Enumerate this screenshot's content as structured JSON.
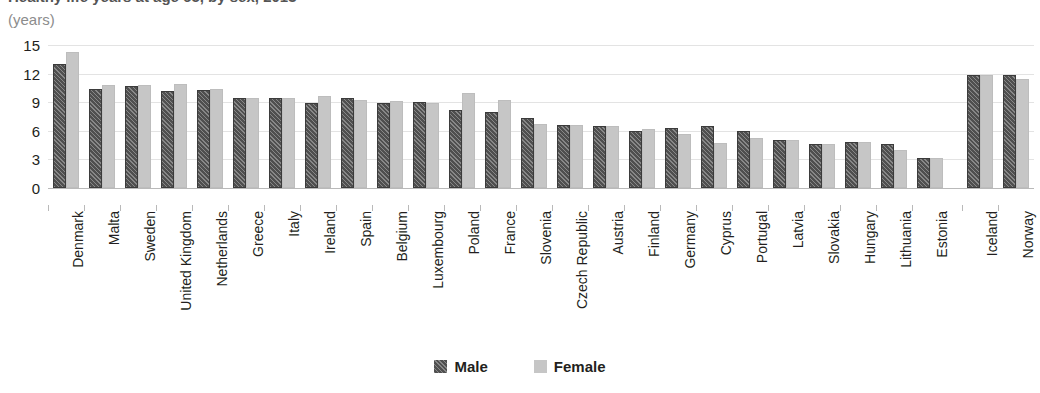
{
  "header": {
    "title_clipped": "Healthy life years at age 65, by sex, 2013",
    "units": "(years)"
  },
  "legend": {
    "position": "bottom-center",
    "items": [
      {
        "label": "Male",
        "color": "#4f4f4f",
        "pattern": "diagonal-hatch"
      },
      {
        "label": "Female",
        "color": "#c6c6c6",
        "pattern": "solid"
      }
    ]
  },
  "chart_data": {
    "type": "bar",
    "title": "Healthy life years at age 65, by sex, 2013",
    "xlabel": "",
    "ylabel": "(years)",
    "ylim": [
      0,
      15
    ],
    "yticks": [
      0,
      3,
      6,
      9,
      12,
      15
    ],
    "grid": true,
    "orientation": "vertical",
    "grouping": "grouped",
    "categories": [
      "Denmark",
      "Malta",
      "Sweden",
      "United Kingdom",
      "Netherlands",
      "Greece",
      "Italy",
      "Ireland",
      "Spain",
      "Belgium",
      "Luxembourg",
      "Poland",
      "France",
      "Slovenia",
      "Czech Republic",
      "Austria",
      "Finland",
      "Germany",
      "Cyprus",
      "Portugal",
      "Latvia",
      "Slovakia",
      "Hungary",
      "Lithuania",
      "Estonia",
      "Iceland",
      "Norway"
    ],
    "separator_before": "Iceland",
    "series": [
      {
        "name": "Male",
        "color": "#4f4f4f",
        "values": [
          13.0,
          10.4,
          10.7,
          10.2,
          10.3,
          9.4,
          9.4,
          8.9,
          9.4,
          8.9,
          9.0,
          8.2,
          8.0,
          7.3,
          6.6,
          6.5,
          6.0,
          6.3,
          6.5,
          6.0,
          5.0,
          4.6,
          4.8,
          4.6,
          3.2,
          11.9,
          11.9
        ]
      },
      {
        "name": "Female",
        "color": "#c6c6c6",
        "values": [
          14.3,
          10.8,
          10.8,
          10.9,
          10.4,
          9.4,
          9.4,
          9.6,
          9.2,
          9.1,
          8.9,
          10.0,
          9.2,
          6.7,
          6.6,
          6.5,
          6.2,
          5.7,
          4.7,
          5.2,
          5.0,
          4.6,
          4.8,
          4.0,
          3.2,
          11.9,
          11.4
        ]
      }
    ]
  }
}
